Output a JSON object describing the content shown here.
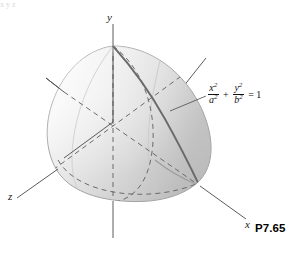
{
  "figure": {
    "caption": "P7.65",
    "axes": [
      {
        "name": "y",
        "label": "y"
      },
      {
        "name": "z",
        "label": "z"
      },
      {
        "name": "x",
        "label": "x"
      }
    ],
    "equation": {
      "term1_numerator": "x",
      "term1_denominator": "a",
      "term1_num_exponent": "2",
      "term1_den_exponent": "2",
      "operator": "+",
      "term2_numerator": "y",
      "term2_denominator": "b",
      "term2_num_exponent": "2",
      "term2_den_exponent": "2",
      "equals": "= 1",
      "plain": "x^2/a^2 + y^2/b^2 = 1"
    },
    "top_artifact": "x    y    z",
    "colors": {
      "surface_light": "#fdfdfd",
      "surface_mid": "#e4e4e4",
      "surface_dark": "#c3c3c3",
      "outline": "#8f8f8f",
      "axis": "#4a4a4a",
      "hidden_line": "#6a6a6a",
      "section_curve": "#6b6b6b",
      "text": "#111111",
      "background": "#ffffff"
    }
  }
}
